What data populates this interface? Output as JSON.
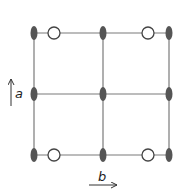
{
  "diagram": {
    "axis_labels": {
      "a": "a",
      "b": "b"
    },
    "colors": {
      "line": "#7a7a7a",
      "filled_atom": "#555555",
      "open_atom_stroke": "#444444",
      "arrow": "#333333"
    },
    "grid": {
      "columns_x": [
        34,
        103,
        169
      ],
      "rows_y": [
        33,
        94,
        155
      ]
    },
    "filled_atoms": [
      {
        "x": 34,
        "y": 33
      },
      {
        "x": 103,
        "y": 33
      },
      {
        "x": 169,
        "y": 33
      },
      {
        "x": 34,
        "y": 94
      },
      {
        "x": 103,
        "y": 94
      },
      {
        "x": 169,
        "y": 94
      },
      {
        "x": 34,
        "y": 155
      },
      {
        "x": 103,
        "y": 155
      },
      {
        "x": 169,
        "y": 155
      }
    ],
    "open_atoms": [
      {
        "x": 54,
        "y": 33
      },
      {
        "x": 148,
        "y": 33
      },
      {
        "x": 54,
        "y": 155
      },
      {
        "x": 148,
        "y": 155
      }
    ]
  }
}
